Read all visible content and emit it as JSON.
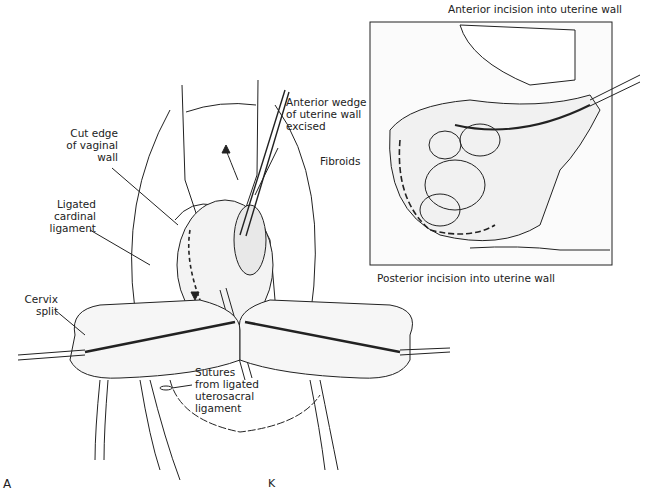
{
  "figure": {
    "panel_label": "A",
    "signature": "K",
    "main_labels": {
      "anterior_wedge": [
        "Anterior wedge",
        "of uterine wall",
        "excised"
      ],
      "fibroids": "Fibroids",
      "cut_edge": [
        "Cut edge",
        "of vaginal",
        "wall"
      ],
      "cardinal": [
        "Ligated",
        "cardinal",
        "ligament"
      ],
      "cervix": [
        "Cervix",
        "split"
      ],
      "sutures": [
        "Sutures",
        "from ligated",
        "uterosacral",
        "ligament"
      ]
    },
    "inset": {
      "top_caption": "Anterior incision into uterine wall",
      "bottom_caption": "Posterior incision into uterine wall"
    }
  }
}
